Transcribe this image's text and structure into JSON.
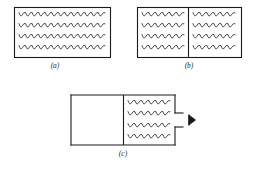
{
  "figure": {
    "background_color": "#fefefe",
    "line_color": "#1a1a1a",
    "wave_color": "#2a2a2a",
    "panels": [
      {
        "id": "a",
        "label": "(a)",
        "description": "Closed rectangular container uniformly filled with wavy particle traces",
        "box": {
          "x": 14,
          "y": 7,
          "width": 96,
          "height": 50
        },
        "divider": null,
        "wave_rows": 4,
        "wave_regions": [
          {
            "side": "full",
            "x": 19,
            "width": 86,
            "rows_y": [
              15,
              26,
              37,
              48
            ],
            "cycles": 13
          }
        ],
        "opening": null,
        "arrow": null
      },
      {
        "id": "b",
        "label": "(b)",
        "description": "Rectangular container split by a central vertical partition, both halves filled with wavy particle traces",
        "box": {
          "x": 137,
          "y": 7,
          "width": 104,
          "height": 50
        },
        "divider": {
          "x": 188,
          "y1": 7,
          "y2": 57
        },
        "wave_rows": 4,
        "wave_regions": [
          {
            "side": "left",
            "x": 142,
            "width": 42,
            "rows_y": [
              15,
              26,
              37,
              48
            ],
            "cycles": 6
          },
          {
            "side": "right",
            "x": 193,
            "width": 42,
            "rows_y": [
              15,
              26,
              37,
              48
            ],
            "cycles": 6
          }
        ],
        "opening": null,
        "arrow": null
      },
      {
        "id": "c",
        "label": "(c)",
        "description": "Rectangular container with empty left half, partition, wavy particle traces in right half, and a gap in the right wall with an arrow showing outflow",
        "box": {
          "x": 71,
          "y": 95,
          "width": 104,
          "height": 50
        },
        "divider": {
          "x": 123,
          "y1": 95,
          "y2": 145
        },
        "wave_rows": 4,
        "wave_regions": [
          {
            "side": "right",
            "x": 128,
            "width": 42,
            "rows_y": [
              103,
              114,
              126,
              137
            ],
            "cycles": 6
          }
        ],
        "opening": {
          "x": 175,
          "y_top": 95,
          "gap_top": 113,
          "gap_bottom": 127,
          "y_bottom": 145,
          "notch_extend": 8
        },
        "arrow": {
          "x": 189,
          "y": 120,
          "direction": "right",
          "size": 7
        }
      }
    ]
  }
}
